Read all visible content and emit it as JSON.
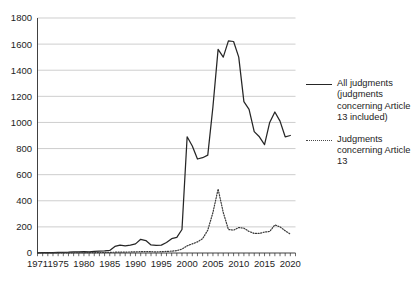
{
  "chart_data": {
    "type": "line",
    "title": "",
    "xlabel": "",
    "ylabel": "",
    "xlim": [
      1971,
      2021
    ],
    "ylim": [
      0,
      1800
    ],
    "grid": true,
    "legend_position": "right",
    "y_ticks": [
      0,
      200,
      400,
      600,
      800,
      1000,
      1200,
      1400,
      1600,
      1800
    ],
    "y_tick_labels": [
      "0",
      "200",
      "400",
      "600",
      "800",
      "1000",
      "1200",
      "1400",
      "1600",
      "1800"
    ],
    "x_ticks": [
      1971,
      1975,
      1980,
      1985,
      1990,
      1995,
      2000,
      2005,
      2010,
      2015,
      2020
    ],
    "x_tick_labels": [
      "1971",
      "1975",
      "1980",
      "1985",
      "1990",
      "1995",
      "2000",
      "2005",
      "2010",
      "2015",
      "2020"
    ],
    "x": [
      1971,
      1972,
      1973,
      1974,
      1975,
      1976,
      1977,
      1978,
      1979,
      1980,
      1981,
      1982,
      1983,
      1984,
      1985,
      1986,
      1987,
      1988,
      1989,
      1990,
      1991,
      1992,
      1993,
      1994,
      1995,
      1996,
      1997,
      1998,
      1999,
      2000,
      2001,
      2002,
      2003,
      2004,
      2005,
      2006,
      2007,
      2008,
      2009,
      2010,
      2011,
      2012,
      2013,
      2014,
      2015,
      2016,
      2017,
      2018,
      2019,
      2020
    ],
    "series": [
      {
        "name": "All judgments (judgments concerning Article 13 included)",
        "style": "solid",
        "color": "#262626",
        "values": [
          1,
          2,
          3,
          2,
          4,
          5,
          6,
          8,
          8,
          10,
          9,
          12,
          14,
          16,
          20,
          50,
          60,
          55,
          60,
          70,
          105,
          95,
          62,
          58,
          60,
          80,
          110,
          120,
          180,
          890,
          820,
          720,
          730,
          750,
          1120,
          1560,
          1500,
          1625,
          1620,
          1500,
          1160,
          1100,
          930,
          890,
          830,
          1000,
          1080,
          1010,
          890,
          900
        ]
      },
      {
        "name": "Judgments concerning Article 13",
        "style": "dotted",
        "color": "#3a3a3a",
        "values": [
          0,
          0,
          0,
          0,
          1,
          1,
          1,
          2,
          2,
          2,
          3,
          3,
          4,
          4,
          5,
          6,
          6,
          7,
          8,
          9,
          10,
          11,
          10,
          9,
          10,
          12,
          14,
          18,
          30,
          55,
          70,
          85,
          110,
          175,
          310,
          490,
          310,
          180,
          175,
          195,
          190,
          165,
          150,
          150,
          160,
          165,
          215,
          200,
          170,
          145
        ]
      }
    ]
  },
  "legend": {
    "entries": [
      {
        "label": "All judgments (judgments concerning Article 13 included)",
        "style": "solid"
      },
      {
        "label": "Judgments concerning Article 13",
        "style": "dotted"
      }
    ]
  }
}
